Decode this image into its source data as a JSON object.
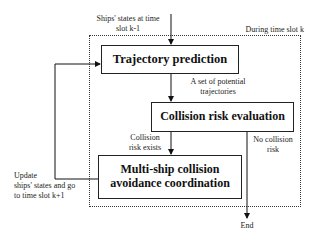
{
  "diagram": {
    "region_label": "During time slot k",
    "nodes": {
      "trajectory": "Trajectory prediction",
      "collision": "Collision risk evaluation",
      "coordination_line1": "Multi-ship collision",
      "coordination_line2": "avoidance coordination"
    },
    "edges": {
      "input_line1": "Ships' states at time",
      "input_line2": "slot k-1",
      "traj_out_line1": "A set of potential",
      "traj_out_line2": "trajectories",
      "risk_yes_line1": "Collision",
      "risk_yes_line2": "risk exists",
      "risk_no_line1": "No collision",
      "risk_no_line2": "risk",
      "feedback_line1": "Update",
      "feedback_line2": "ships' states and go",
      "feedback_line3": "to time slot k+1",
      "end": "End"
    }
  }
}
